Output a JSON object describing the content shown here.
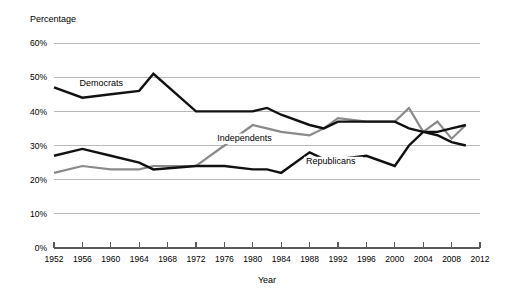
{
  "chart_data": {
    "type": "line",
    "title": "",
    "xlabel": "Year",
    "ylabel": "Percentage",
    "xlim": [
      1952,
      2012
    ],
    "ylim": [
      0,
      60
    ],
    "grid": true,
    "legend_position": "inline-labels",
    "x_tick_labels": [
      "1952",
      "1956",
      "1960",
      "1964",
      "1968",
      "1972",
      "1976",
      "1980",
      "1984",
      "1988",
      "1992",
      "1996",
      "2000",
      "2004",
      "2008",
      "2012"
    ],
    "y_tick_labels": [
      "0%",
      "10%",
      "20%",
      "30%",
      "40%",
      "50%",
      "60%"
    ],
    "x": [
      1952,
      1956,
      1960,
      1964,
      1966,
      1972,
      1976,
      1980,
      1982,
      1984,
      1988,
      1990,
      1992,
      1996,
      2000,
      2002,
      2004,
      2006,
      2008,
      2010
    ],
    "series": [
      {
        "name": "Democrats",
        "color": "#111111",
        "x": [
          1952,
          1956,
          1960,
          1964,
          1966,
          1972,
          1976,
          1980,
          1982,
          1984,
          1988,
          1990,
          1992,
          1996,
          2000,
          2002,
          2004,
          2006,
          2008,
          2010
        ],
        "values": [
          47,
          44,
          45,
          46,
          51,
          40,
          40,
          40,
          41,
          39,
          36,
          35,
          37,
          37,
          37,
          35,
          34,
          33,
          31,
          30
        ]
      },
      {
        "name": "Independents",
        "color": "#8a8a8a",
        "x": [
          1952,
          1956,
          1960,
          1964,
          1966,
          1972,
          1976,
          1980,
          1982,
          1984,
          1988,
          1990,
          1992,
          1996,
          2000,
          2002,
          2004,
          2006,
          2008,
          2010
        ],
        "values": [
          22,
          24,
          23,
          23,
          24,
          24,
          30,
          36,
          35,
          34,
          33,
          35,
          38,
          37,
          37,
          41,
          34,
          37,
          32,
          36
        ]
      },
      {
        "name": "Republicans",
        "color": "#111111",
        "x": [
          1952,
          1956,
          1960,
          1964,
          1966,
          1972,
          1976,
          1980,
          1982,
          1984,
          1988,
          1990,
          1992,
          1996,
          2000,
          2002,
          2004,
          2006,
          2008,
          2010
        ],
        "values": [
          27,
          29,
          27,
          25,
          23,
          24,
          24,
          23,
          23,
          22,
          28,
          26,
          26,
          27,
          24,
          30,
          34,
          34,
          35,
          36
        ]
      }
    ],
    "series_labels": [
      {
        "text": "Democrats",
        "x": 1955.6,
        "y": 47.5
      },
      {
        "text": "Independents",
        "x": 1975.0,
        "y": 31.3
      },
      {
        "text": "Republicans",
        "x": 1987.5,
        "y": 24.5
      }
    ]
  }
}
